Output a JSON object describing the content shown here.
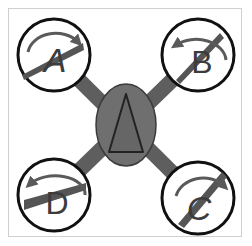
{
  "diagram": {
    "type": "quadcopter-rotor-layout",
    "body": {
      "label": "",
      "symbol": "triangle",
      "fill": "#6f6f6f",
      "stroke": "#3a3a3a"
    },
    "arm_color": "#5e5e5e",
    "rotors": [
      {
        "id": "A",
        "label": "A",
        "position": "top-left",
        "rotation": "clockwise"
      },
      {
        "id": "B",
        "label": "B",
        "position": "top-right",
        "rotation": "counterclockwise"
      },
      {
        "id": "C",
        "label": "C",
        "position": "bottom-right",
        "rotation": "clockwise"
      },
      {
        "id": "D",
        "label": "D",
        "position": "bottom-left",
        "rotation": "counterclockwise"
      }
    ],
    "colors": {
      "rotor_ring": "#111111",
      "propeller": "#555555",
      "arrow": "#5a5a5a",
      "letter": "#3c3c3c",
      "frame_border": "#cfcfcf"
    }
  }
}
